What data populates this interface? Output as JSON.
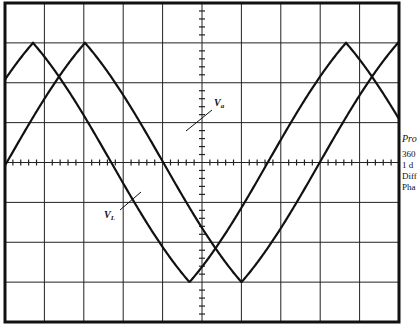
{
  "figure": {
    "type": "oscilloscope-trace",
    "grid": {
      "columns": 10,
      "rows": 8,
      "minor_ticks_per_division": 5
    },
    "frame": {
      "left": 5,
      "top": 3,
      "right": 399,
      "bottom": 322
    },
    "colors": {
      "ink": "#111111",
      "grid": "#222222",
      "background": "#ffffff"
    },
    "traces": [
      {
        "name": "V_L",
        "label_main": "V",
        "label_sub": "L",
        "peak_x": 33,
        "period_px": 313
      },
      {
        "name": "V_a",
        "label_main": "V",
        "label_sub": "a",
        "peak_x": 85,
        "period_px": 313
      }
    ],
    "labels": {
      "va": {
        "main": "V",
        "sub": "a"
      },
      "vl": {
        "main": "V",
        "sub": "L"
      }
    }
  },
  "side_text": {
    "title": "Pro",
    "line1": "360",
    "line2": "1 d",
    "line3": "Diff",
    "line4": "Pha"
  }
}
